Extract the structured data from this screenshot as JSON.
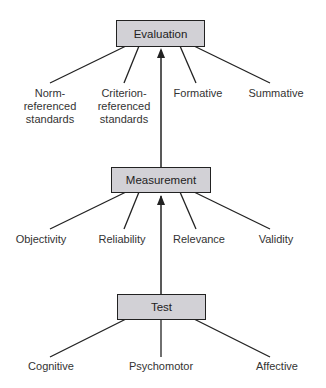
{
  "diagram": {
    "nodes": {
      "evaluation": "Evaluation",
      "measurement": "Measurement",
      "test": "Test"
    },
    "evaluation_children": [
      {
        "line1": "Norm-",
        "line2": "referenced",
        "line3": "standards"
      },
      {
        "line1": "Criterion-",
        "line2": "referenced",
        "line3": "standards"
      },
      {
        "line1": "Formative"
      },
      {
        "line1": "Summative"
      }
    ],
    "measurement_children": [
      "Objectivity",
      "Reliability",
      "Relevance",
      "Validity"
    ],
    "test_children": [
      "Cognitive",
      "Psychomotor",
      "Affective"
    ],
    "edges": [
      {
        "from": "Test",
        "to": "Measurement",
        "type": "arrow"
      },
      {
        "from": "Measurement",
        "to": "Evaluation",
        "type": "arrow"
      }
    ],
    "colors": {
      "box_fill": "#d2d1d6",
      "line": "#222222",
      "text": "#333333"
    }
  }
}
